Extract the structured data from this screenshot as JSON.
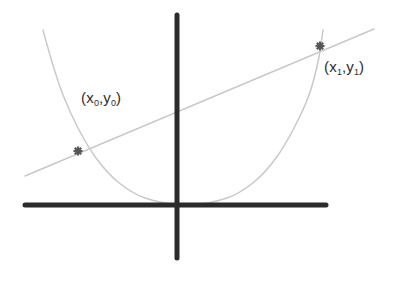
{
  "figure": {
    "background_color": "#ffffff",
    "width": 400,
    "height": 282,
    "axis_color": "#2b2b2b",
    "curve_color": "#c9c9c9",
    "secant_color": "#c9c9c9",
    "marker_color": "#565656",
    "label_color": "#2e2e2e"
  },
  "axes": {
    "x_axis": {
      "name": "x-axis",
      "x_start": 25,
      "x_end": 326,
      "y": 205,
      "thickness": 5
    },
    "y_axis": {
      "name": "y-axis",
      "x": 177,
      "y_start": 15,
      "y_end": 258,
      "thickness": 5
    },
    "origin": {
      "x": 177,
      "y": 205
    }
  },
  "labels": {
    "point0": {
      "open_paren": "(",
      "x_var": "x",
      "x_sub": "0",
      "comma": ",",
      "y_var": "y",
      "y_sub": "0",
      "close_paren": ")",
      "full_text": "( x0, y0 )"
    },
    "point1": {
      "open_paren": "(",
      "x_var": "x",
      "x_sub": "1",
      "comma": ",",
      "y_var": "y",
      "y_sub": "1",
      "close_paren": ")",
      "full_text": "( x1, y1 )"
    }
  },
  "chart_data": {
    "type": "line",
    "xlabel": "",
    "ylabel": "",
    "grid": false,
    "legend": "none",
    "xlim": [
      0,
      400
    ],
    "ylim": [
      282,
      0
    ],
    "series": [
      {
        "name": "parabola",
        "kind": "curve",
        "color": "#c9c9c9",
        "stroke_width": 1.5,
        "description": "Upward-opening parabola with vertex resting on the x-axis",
        "vertex": {
          "x": 186,
          "y": 205
        },
        "points": [
          {
            "x": 43,
            "y": 30
          },
          {
            "x": 52,
            "y": 62
          },
          {
            "x": 63,
            "y": 95
          },
          {
            "x": 78,
            "y": 128
          },
          {
            "x": 96,
            "y": 158
          },
          {
            "x": 118,
            "y": 182
          },
          {
            "x": 145,
            "y": 198
          },
          {
            "x": 186,
            "y": 205
          },
          {
            "x": 227,
            "y": 198
          },
          {
            "x": 254,
            "y": 182
          },
          {
            "x": 276,
            "y": 158
          },
          {
            "x": 294,
            "y": 128
          },
          {
            "x": 309,
            "y": 95
          },
          {
            "x": 318,
            "y": 62
          },
          {
            "x": 323,
            "y": 30
          }
        ]
      },
      {
        "name": "secant-line",
        "kind": "line",
        "color": "#c9c9c9",
        "stroke_width": 1.5,
        "description": "Straight secant line passing through both marked points",
        "start": {
          "x": 25,
          "y": 176
        },
        "end": {
          "x": 374,
          "y": 29
        }
      }
    ],
    "markers": [
      {
        "name": "point-x0-y0",
        "label": "( x0, y0 )",
        "glyph": "asterisk-burst",
        "x": 78,
        "y": 151,
        "color": "#565656",
        "size": 9
      },
      {
        "name": "point-x1-y1",
        "label": "( x1, y1 )",
        "glyph": "asterisk-burst",
        "x": 320,
        "y": 46,
        "color": "#565656",
        "size": 9
      }
    ],
    "annotations": [
      {
        "text": "( x0, y0 )",
        "x": 82,
        "y": 99,
        "anchor": "start"
      },
      {
        "text": "( x1, y1 )",
        "x": 325,
        "y": 68,
        "anchor": "start"
      }
    ]
  }
}
